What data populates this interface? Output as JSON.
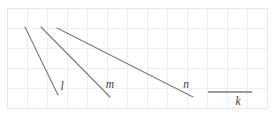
{
  "figure": {
    "background_color": "#ffffff",
    "grid": {
      "cell_size": 20,
      "line_color": "#eceef1",
      "border_color": "#e4e6ea",
      "x_start": 7,
      "y_start": 8,
      "columns": 13,
      "rows": 5,
      "visible": true
    },
    "line_color": "#7b7b7b",
    "label_color": "#3a3a3a"
  },
  "chart_data": {
    "type": "line",
    "title": "",
    "xlabel": "",
    "ylabel": "",
    "grid": true,
    "legend_position": "inline-end-labels",
    "xlim": [
      7,
      267
    ],
    "ylim": [
      8,
      108
    ],
    "annotations": [
      "l",
      "m",
      "n",
      "k"
    ],
    "series": [
      {
        "name": "l",
        "label": "l",
        "label_x": 62,
        "label_y": 90,
        "x": [
          25,
          58
        ],
        "y": [
          27,
          95
        ],
        "slope_description": "steepest negative slope"
      },
      {
        "name": "m",
        "label": "m",
        "label_x": 110,
        "label_y": 88,
        "x": [
          41,
          110
        ],
        "y": [
          27,
          97
        ],
        "slope_description": "steep negative slope"
      },
      {
        "name": "n",
        "label": "n",
        "label_x": 186,
        "label_y": 88,
        "x": [
          57,
          193
        ],
        "y": [
          28,
          97
        ],
        "slope_description": "shallow negative slope"
      },
      {
        "name": "k",
        "label": "k",
        "label_x": 238,
        "label_y": 105,
        "x": [
          208,
          252
        ],
        "y": [
          92,
          92
        ],
        "slope_description": "horizontal, zero slope"
      }
    ]
  }
}
